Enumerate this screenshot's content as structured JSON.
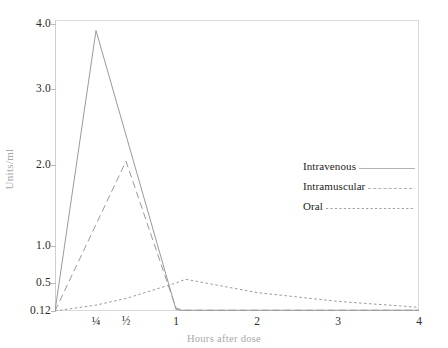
{
  "chart_data": {
    "type": "line",
    "title": "",
    "xlabel": "Hours after dose",
    "ylabel": "Units/ml",
    "grid": false,
    "legend_position": "right-center",
    "y_scale": "non-linear (compressed, log-like)",
    "yticks": [
      0.12,
      0.5,
      1.0,
      2.0,
      3.0,
      4.0
    ],
    "ytick_labels": [
      "0.12",
      "0.5",
      "1.0",
      "2.0",
      "3.0",
      "4.0"
    ],
    "ylim": [
      0.12,
      4.0
    ],
    "xticks": [
      0.25,
      0.5,
      1,
      2,
      3,
      4
    ],
    "xtick_labels": [
      "¼",
      "½",
      "1",
      "2",
      "3",
      "4"
    ],
    "xlim": [
      0,
      4
    ],
    "series": [
      {
        "name": "Intravenous",
        "style": "solid",
        "color": "#9a9a9a",
        "x": [
          0,
          0.25,
          1.0,
          1.05,
          4.0
        ],
        "values": [
          0.12,
          3.9,
          0.14,
          0.13,
          0.13
        ]
      },
      {
        "name": "Intramuscular",
        "style": "dashed",
        "color": "#9a9a9a",
        "x": [
          0,
          0.5,
          1.0,
          1.08,
          4.0
        ],
        "values": [
          0.12,
          2.05,
          0.16,
          0.13,
          0.13
        ]
      },
      {
        "name": "Oral",
        "style": "dotted",
        "color": "#9a9a9a",
        "x": [
          0,
          0.25,
          0.5,
          1.0,
          1.12,
          2.0,
          3.0,
          4.0
        ],
        "values": [
          0.12,
          0.2,
          0.29,
          0.5,
          0.55,
          0.37,
          0.25,
          0.17
        ]
      }
    ]
  },
  "legend": {
    "items": [
      {
        "label": "Intravenous",
        "style": "solid"
      },
      {
        "label": "Intramuscular",
        "style": "dashed"
      },
      {
        "label": "Oral",
        "style": "dotted"
      }
    ]
  },
  "axes": {
    "y_title": "Units/ml",
    "x_title": "Hours after dose"
  }
}
